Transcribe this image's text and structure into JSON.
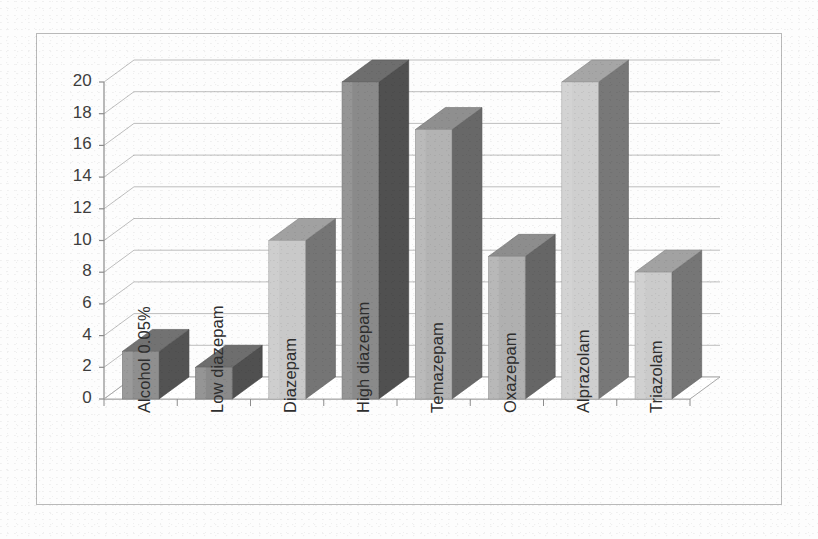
{
  "chart_data": {
    "type": "bar",
    "title": "",
    "subtitle": "",
    "xlabel": "",
    "ylabel": "",
    "categories": [
      "Alcohol 0.05%",
      "Low diazepam",
      "Diazepam",
      "High diazepam",
      "Temazepam",
      "Oxazepam",
      "Alprazolam",
      "Triazolam"
    ],
    "values": [
      3,
      2,
      10,
      20,
      17,
      9,
      20,
      8
    ],
    "bar_colors": [
      "#8f8f8f",
      "#8a8a8a",
      "#c9c9c9",
      "#8a8a8a",
      "#b3b3b3",
      "#b0b0b0",
      "#cfcfcf",
      "#cbcbcb"
    ],
    "ylim": [
      0,
      20
    ],
    "yticks": [
      0,
      2,
      4,
      6,
      8,
      10,
      12,
      14,
      16,
      18,
      20
    ],
    "ytick_labels": [
      "0",
      "2",
      "4",
      "6",
      "8",
      "10",
      "12",
      "14",
      "16",
      "18",
      "20"
    ],
    "grid": true,
    "legend": "none",
    "style": "3d-column",
    "series": [
      {
        "name": "",
        "values": [
          3,
          2,
          10,
          20,
          17,
          9,
          20,
          8
        ]
      }
    ]
  }
}
